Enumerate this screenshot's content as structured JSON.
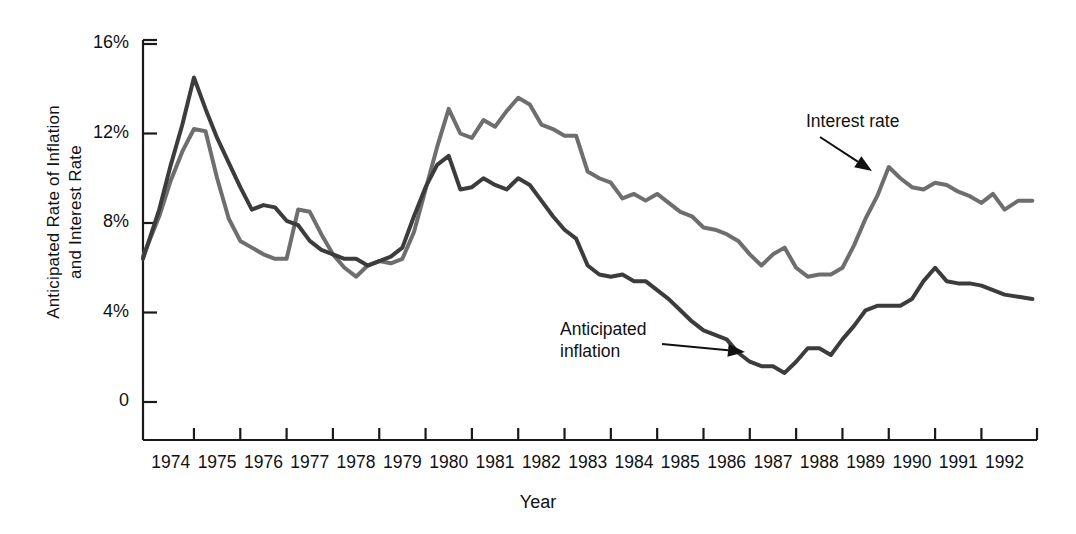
{
  "chart_data": {
    "type": "line",
    "title": "",
    "xlabel": "Year",
    "ylabel": "Anticipated Rate of  Inflation and Interest Rate",
    "ylabel_line1": "Anticipated Rate of  Inflation",
    "ylabel_line2": "and Interest Rate",
    "ytick_labels": [
      "16%",
      "12%",
      "8%",
      "4%",
      "0"
    ],
    "ytick_values": [
      16,
      12,
      8,
      4,
      0
    ],
    "ylim": [
      0,
      17.6
    ],
    "xtick_labels": [
      "1974",
      "1975",
      "1976",
      "1977",
      "1978",
      "1979",
      "1980",
      "1981",
      "1982",
      "1983",
      "1984",
      "1985",
      "1986",
      "1987",
      "1988",
      "1989",
      "1990",
      "1991",
      "1992"
    ],
    "xlim": [
      1973.4,
      1992.7
    ],
    "grid": false,
    "legend_position": "annotations-on-plot",
    "annotations": [
      {
        "text": "Interest rate",
        "target_series": "Interest rate",
        "arrow": "down-right"
      },
      {
        "text": "Anticipated inflation",
        "target_series": "Anticipated inflation",
        "arrow": "right"
      }
    ],
    "series": [
      {
        "name": "Interest rate",
        "color": "#6e6e6e",
        "x": [
          1973.4,
          1973.75,
          1974.0,
          1974.25,
          1974.5,
          1974.75,
          1975.0,
          1975.25,
          1975.5,
          1975.75,
          1976.0,
          1976.25,
          1976.5,
          1976.75,
          1977.0,
          1977.25,
          1977.5,
          1977.75,
          1978.0,
          1978.25,
          1978.5,
          1978.75,
          1979.0,
          1979.25,
          1979.5,
          1979.75,
          1980.0,
          1980.25,
          1980.5,
          1980.75,
          1981.0,
          1981.25,
          1981.5,
          1981.75,
          1982.0,
          1982.25,
          1982.5,
          1982.75,
          1983.0,
          1983.25,
          1983.5,
          1983.75,
          1984.0,
          1984.25,
          1984.5,
          1984.75,
          1985.0,
          1985.25,
          1985.5,
          1985.75,
          1986.0,
          1986.25,
          1986.5,
          1986.75,
          1987.0,
          1987.25,
          1987.5,
          1987.75,
          1988.0,
          1988.25,
          1988.5,
          1988.75,
          1989.0,
          1989.25,
          1989.5,
          1989.75,
          1990.0,
          1990.25,
          1990.5,
          1990.75,
          1991.0,
          1991.25,
          1991.5,
          1991.75,
          1992.0,
          1992.3,
          1992.6
        ],
        "y": [
          6.5,
          8.3,
          9.9,
          11.2,
          12.2,
          12.1,
          10.0,
          8.2,
          7.2,
          6.9,
          6.6,
          6.4,
          6.4,
          8.6,
          8.5,
          7.5,
          6.6,
          6.0,
          5.6,
          6.1,
          6.3,
          6.2,
          6.4,
          7.6,
          9.5,
          11.4,
          13.1,
          12.0,
          11.8,
          12.6,
          12.3,
          13.0,
          13.6,
          13.3,
          12.4,
          12.2,
          11.9,
          11.9,
          10.3,
          10.0,
          9.8,
          9.1,
          9.3,
          9.0,
          9.3,
          8.9,
          8.5,
          8.3,
          7.8,
          7.7,
          7.5,
          7.2,
          6.6,
          6.1,
          6.6,
          6.9,
          6.0,
          5.6,
          5.7,
          5.7,
          6.0,
          7.0,
          8.2,
          9.2,
          10.5,
          10.0,
          9.6,
          9.5,
          9.8,
          9.7,
          9.4,
          9.2,
          8.9,
          9.3,
          8.6,
          9.0,
          9.0
        ]
      },
      {
        "name": "Anticipated inflation",
        "color": "#3c3c3c",
        "x": [
          1973.4,
          1973.75,
          1974.0,
          1974.25,
          1974.5,
          1974.75,
          1975.0,
          1975.25,
          1975.5,
          1975.75,
          1976.0,
          1976.25,
          1976.5,
          1976.75,
          1977.0,
          1977.25,
          1977.5,
          1977.75,
          1978.0,
          1978.25,
          1978.5,
          1978.75,
          1979.0,
          1979.25,
          1979.5,
          1979.75,
          1980.0,
          1980.25,
          1980.5,
          1980.75,
          1981.0,
          1981.25,
          1981.5,
          1981.75,
          1982.0,
          1982.25,
          1982.5,
          1982.75,
          1983.0,
          1983.25,
          1983.5,
          1983.75,
          1984.0,
          1984.25,
          1984.5,
          1984.75,
          1985.0,
          1985.25,
          1985.5,
          1985.75,
          1986.0,
          1986.25,
          1986.5,
          1986.75,
          1987.0,
          1987.25,
          1987.5,
          1987.75,
          1988.0,
          1988.25,
          1988.5,
          1988.75,
          1989.0,
          1989.25,
          1989.5,
          1989.75,
          1990.0,
          1990.25,
          1990.5,
          1990.75,
          1991.0,
          1991.25,
          1991.5,
          1991.75,
          1992.0,
          1992.3,
          1992.6
        ],
        "y": [
          6.4,
          8.6,
          10.6,
          12.4,
          14.5,
          13.1,
          11.8,
          10.7,
          9.6,
          8.6,
          8.8,
          8.7,
          8.1,
          7.9,
          7.2,
          6.8,
          6.6,
          6.4,
          6.4,
          6.1,
          6.3,
          6.5,
          6.9,
          8.3,
          9.6,
          10.6,
          11.0,
          9.5,
          9.6,
          10.0,
          9.7,
          9.5,
          10.0,
          9.7,
          9.0,
          8.3,
          7.7,
          7.3,
          6.1,
          5.7,
          5.6,
          5.7,
          5.4,
          5.4,
          5.0,
          4.6,
          4.1,
          3.6,
          3.2,
          3.0,
          2.8,
          2.2,
          1.8,
          1.6,
          1.6,
          1.3,
          1.8,
          2.4,
          2.4,
          2.1,
          2.8,
          3.4,
          4.1,
          4.3,
          4.3,
          4.3,
          4.6,
          5.4,
          6.0,
          5.4,
          5.3,
          5.3,
          5.2,
          5.0,
          4.8,
          4.7,
          4.6
        ]
      }
    ]
  },
  "axis": {
    "axis_color": "#1a1a1a",
    "tick_color": "#1a1a1a"
  },
  "annotations": {
    "interest_rate": "Interest rate",
    "anticipated_inflation_line1": "Anticipated",
    "anticipated_inflation_line2": "inflation"
  }
}
